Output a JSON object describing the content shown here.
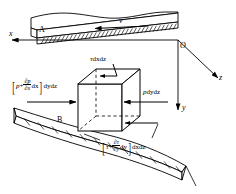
{
  "figure": {
    "plates": {
      "top_label": "A",
      "bottom_label": "B"
    },
    "axes": {
      "origin_label": "O",
      "x_label": "x",
      "y_label": "y",
      "z_label": "z"
    },
    "velocity": {
      "label": "v"
    },
    "forces": {
      "top_shear": {
        "tau": "τ",
        "area": "dxdz"
      },
      "right_pressure": {
        "p": "p",
        "area": "dydz"
      },
      "left_pressure": {
        "open_bracket": "[",
        "close_bracket": "]",
        "p": "p",
        "plus": "+",
        "num": "∂p",
        "den": "∂x",
        "dx": "dx",
        "area": "dydz"
      },
      "bottom_shear": {
        "open_bracket": "[",
        "close_bracket": "]",
        "tau": "τ",
        "plus": "+",
        "num": "∂τ",
        "den": "∂y",
        "dy": "dy",
        "area": "dxdz"
      }
    },
    "colors": {
      "line": "#000000",
      "background": "#ffffff"
    }
  }
}
